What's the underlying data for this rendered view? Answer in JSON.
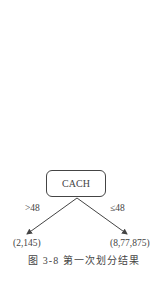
{
  "diagram": {
    "root": {
      "label": "CACH"
    },
    "edges": [
      {
        "label": ">48",
        "to": "(2,145)"
      },
      {
        "label": "≤48",
        "to": "(8,77,875)"
      }
    ],
    "caption": "图 3-8   第一次划分结果"
  }
}
